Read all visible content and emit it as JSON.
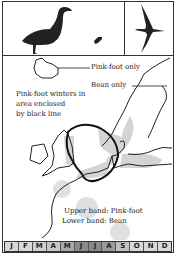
{
  "figure": {
    "title_icons": [
      "goose-standing-icon",
      "goose-small-icon",
      "goose-flying-icon"
    ],
    "labels": {
      "pinkfoot_only": "Pink-foot only",
      "bean_only": "Bean only",
      "winter_line1": "Pink-foot winters in",
      "winter_line2": "area enclosed",
      "winter_line3": "by black line",
      "upper_band": "Upper band: Pink-foot",
      "lower_band": "Lower band: Bean"
    },
    "months": [
      {
        "label": "J",
        "shade": "#d8d8d8"
      },
      {
        "label": "F",
        "shade": "#d8d8d8"
      },
      {
        "label": "M",
        "shade": "#d0d0d0"
      },
      {
        "label": "A",
        "shade": "#c8c8c8"
      },
      {
        "label": "M",
        "shade": "#a8a8a8"
      },
      {
        "label": "J",
        "shade": "#8a8a8a"
      },
      {
        "label": "J",
        "shade": "#8a8a8a"
      },
      {
        "label": "A",
        "shade": "#9a9a9a"
      },
      {
        "label": "S",
        "shade": "#c0c0c0"
      },
      {
        "label": "O",
        "shade": "#d8d8d8"
      },
      {
        "label": "N",
        "shade": "#d8d8d8"
      },
      {
        "label": "D",
        "shade": "#d8d8d8"
      }
    ],
    "colors": {
      "ink": "#222222",
      "range_shade": "#d4d4d4"
    }
  }
}
